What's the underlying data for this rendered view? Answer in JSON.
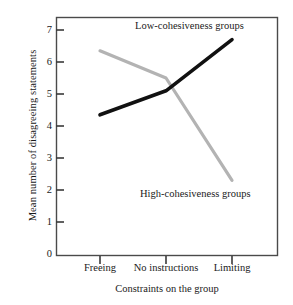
{
  "chart_data": {
    "type": "line",
    "title": "",
    "xlabel": "Constraints on the group",
    "ylabel": "Mean number of disagreeing statements",
    "categories": [
      "Freeing",
      "No instructions",
      "Limiting"
    ],
    "ylim": [
      0,
      7
    ],
    "yticks": [
      0,
      1,
      2,
      3,
      4,
      5,
      6,
      7
    ],
    "grid": false,
    "legend_position": "inline-annotations",
    "series": [
      {
        "name": "Low-cohesiveness groups",
        "color": "#111111",
        "values": [
          4.35,
          5.1,
          6.7
        ]
      },
      {
        "name": "High-cohesiveness groups",
        "color": "#b3b3b3",
        "values": [
          6.35,
          5.5,
          2.3
        ]
      }
    ]
  },
  "axes": {
    "y_title": "Mean number of disagreeing statements",
    "x_title": "Constraints on the group",
    "y_tick_labels": [
      "7",
      "6",
      "5",
      "4",
      "3",
      "2",
      "1",
      "0"
    ],
    "x_tick_labels": [
      "Freeing",
      "No instructions",
      "Limiting"
    ]
  },
  "annotations": {
    "low_label": "Low-cohesiveness groups",
    "high_label": "High-cohesiveness groups"
  },
  "caption": {
    "partial_text": ""
  },
  "colors": {
    "low_series": "#111111",
    "high_series": "#b3b3b3",
    "frame": "#4a4a4a",
    "background": "#ffffff"
  }
}
